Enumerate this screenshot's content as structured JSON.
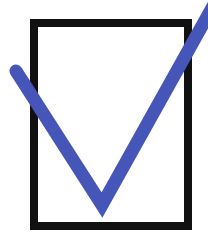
{
  "icon": {
    "name": "checked-checkbox",
    "label": "Checked box",
    "checked": true
  },
  "colors": {
    "box_border": "#111111",
    "box_fill": "#ffffff",
    "check": "#4556b8",
    "background": "#ffffff"
  }
}
